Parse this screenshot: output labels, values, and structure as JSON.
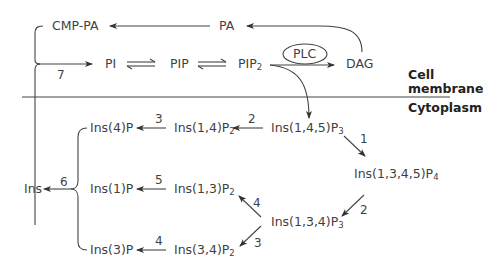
{
  "regions": {
    "membrane_line1": "Cell",
    "membrane_line2": "membrane",
    "cytoplasm": "Cytoplasm"
  },
  "nodes": {
    "cmp_pa": "CMP-PA",
    "pa": "PA",
    "pi": "PI",
    "pip": "PIP",
    "pip2_base": "PIP",
    "pip2_sub": "2",
    "plc": "PLC",
    "dag": "DAG",
    "ins145p3_base": "Ins(1,4,5)P",
    "ins145p3_sub": "3",
    "ins1345p4_base": "Ins(1,3,4,5)P",
    "ins1345p4_sub": "4",
    "ins134p3_base": "Ins(1,3,4)P",
    "ins134p3_sub": "3",
    "ins14p2_base": "Ins(1,4)P",
    "ins14p2_sub": "2",
    "ins13p2_base": "Ins(1,3)P",
    "ins13p2_sub": "2",
    "ins34p2_base": "Ins(3,4)P",
    "ins34p2_sub": "2",
    "ins4p": "Ins(4)P",
    "ins1p": "Ins(1)P",
    "ins3p": "Ins(3)P",
    "ins": "Ins"
  },
  "enzyme_numbers": {
    "e7": "7",
    "e1": "1",
    "e2_to_p4": "2",
    "e2_to_14p2": "2",
    "e3_to_4p": "3",
    "e3_to_34p2": "3",
    "e4_to_13p2": "4",
    "e4_to_3p": "4",
    "e5": "5",
    "e6": "6"
  }
}
